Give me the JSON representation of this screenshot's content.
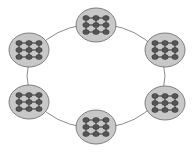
{
  "diagram": {
    "type": "ring-topology",
    "ring": {
      "cx": 96,
      "cy": 76,
      "rx": 69,
      "ry": 52,
      "stroke": "#8a8a8a"
    },
    "node_style": {
      "fill": "#c8c8c8",
      "stroke": "#666666",
      "rx": 20,
      "ry": 17
    },
    "dot_style": {
      "fill": "#555555",
      "link": "#333333",
      "grid_rows": 3,
      "grid_cols": 3
    },
    "nodes": [
      {
        "id": "cluster-top",
        "cx": 96,
        "cy": 25
      },
      {
        "id": "cluster-upper-right",
        "cx": 165,
        "cy": 50
      },
      {
        "id": "cluster-lower-right",
        "cx": 165,
        "cy": 103
      },
      {
        "id": "cluster-bottom",
        "cx": 96,
        "cy": 127
      },
      {
        "id": "cluster-lower-left",
        "cx": 29,
        "cy": 102
      },
      {
        "id": "cluster-upper-left",
        "cx": 29,
        "cy": 50
      }
    ]
  }
}
